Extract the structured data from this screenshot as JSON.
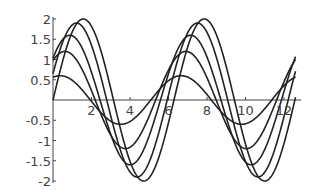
{
  "chart_data": {
    "type": "line",
    "title": "",
    "xlabel": "",
    "ylabel": "",
    "xlim": [
      0,
      12.6
    ],
    "ylim": [
      -2,
      2
    ],
    "grid": false,
    "legend": null,
    "x_ticks": [
      "2",
      "4",
      "6",
      "8",
      "10",
      "12"
    ],
    "y_ticks": [
      "2",
      "1.5",
      "1",
      "0.5",
      "-0.5",
      "-1",
      "-1.5",
      "-2"
    ],
    "series": [
      {
        "name": "curve-1",
        "amplitude": 0.6,
        "phase": 1.2
      },
      {
        "name": "curve-2",
        "amplitude": 1.2,
        "phase": 0.95
      },
      {
        "name": "curve-3",
        "amplitude": 1.6,
        "phase": 0.7
      },
      {
        "name": "curve-4",
        "amplitude": 1.9,
        "phase": 0.35
      },
      {
        "name": "curve-5",
        "amplitude": 2.0,
        "phase": 0.0
      }
    ],
    "line_color": "#222222"
  }
}
